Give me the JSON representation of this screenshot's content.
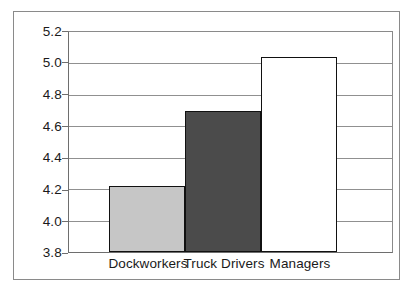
{
  "chart_data": {
    "type": "bar",
    "title": "",
    "subtitle": "",
    "xlabel": "",
    "ylabel": "",
    "categories": [
      "Dockworkers",
      "Truck Drivers",
      "Managers"
    ],
    "values": [
      4.22,
      4.7,
      5.04
    ],
    "series": [
      {
        "name": "",
        "values": [
          4.22,
          4.7,
          5.04
        ]
      }
    ],
    "ylim": [
      3.8,
      5.2
    ],
    "yticks": [
      "3.8",
      "4.0",
      "4.2",
      "4.4",
      "4.6",
      "4.8",
      "5.0",
      "5.2"
    ],
    "ytick_values": [
      3.8,
      4.0,
      4.2,
      4.4,
      4.6,
      4.8,
      5.0,
      5.2
    ],
    "grid": true,
    "legend": false,
    "legend_position": "none",
    "bar_colors": [
      "#c6c6c6",
      "#4b4b4b",
      "#ffffff"
    ],
    "bar_edge_color": "#111111",
    "gridline_color": "#909090",
    "axis_color": "#6e6e6e",
    "frame_color": "#8a8a8a",
    "background_color": "#ffffff",
    "annotations": []
  }
}
